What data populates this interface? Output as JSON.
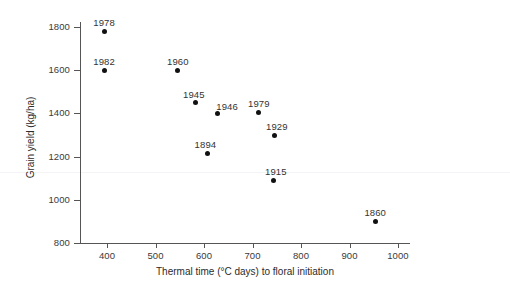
{
  "chart_data": {
    "type": "scatter",
    "title": "",
    "xlabel": "Thermal time (°C days) to floral initiation",
    "ylabel": "Grain yield (kg/ha)",
    "xlim": [
      340,
      1030
    ],
    "ylim": [
      790,
      1850
    ],
    "xticks": [
      400,
      500,
      600,
      700,
      800,
      900,
      1000
    ],
    "xtick_labels": [
      "400",
      "500",
      "600",
      "700",
      "800",
      "900",
      "1000"
    ],
    "yticks": [
      800,
      1000,
      1200,
      1400,
      1600,
      1800
    ],
    "ytick_labels": [
      "800",
      "1000",
      "1200",
      "1400",
      "1600",
      "1800"
    ],
    "grid": false,
    "legend": null,
    "marker": "filled-circle",
    "marker_color": "#111111",
    "points": [
      {
        "label": "1978",
        "x": 394,
        "y": 1780
      },
      {
        "label": "1982",
        "x": 394,
        "y": 1600
      },
      {
        "label": "1960",
        "x": 546,
        "y": 1600
      },
      {
        "label": "1945",
        "x": 583,
        "y": 1450
      },
      {
        "label": "1946",
        "x": 627,
        "y": 1400
      },
      {
        "label": "1894",
        "x": 607,
        "y": 1215
      },
      {
        "label": "1979",
        "x": 713,
        "y": 1405
      },
      {
        "label": "1929",
        "x": 746,
        "y": 1300
      },
      {
        "label": "1915",
        "x": 744,
        "y": 1090
      },
      {
        "label": "1860",
        "x": 953,
        "y": 900
      }
    ],
    "label_offsets": [
      {
        "dx": 0,
        "dy": -14
      },
      {
        "dx": 0,
        "dy": -14
      },
      {
        "dx": 0,
        "dy": -14
      },
      {
        "dx": -2,
        "dy": -14
      },
      {
        "dx": 10,
        "dy": -12
      },
      {
        "dx": -2,
        "dy": -14
      },
      {
        "dx": 0,
        "dy": -14
      },
      {
        "dx": 2,
        "dy": -14
      },
      {
        "dx": 2,
        "dy": -14
      },
      {
        "dx": 0,
        "dy": -14
      }
    ]
  },
  "axes": {
    "x_title": "Thermal time (°C days) to floral initiation",
    "y_title": "Grain yield (kg/ha)"
  },
  "colors": {
    "marker": "#111111",
    "axis": "#555555",
    "text": "#2b2b2b",
    "tick_text": "#3a3a3a",
    "faint_rule": "#f4f4f6",
    "background": "#ffffff"
  }
}
